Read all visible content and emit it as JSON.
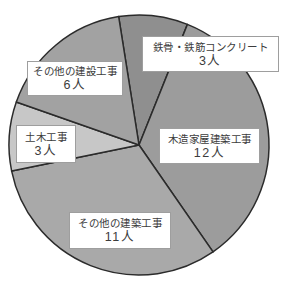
{
  "chart_data": {
    "type": "pie",
    "title": "",
    "unit": "人",
    "total": 35,
    "direction": "clockwise",
    "start_angle_deg": -9,
    "outline_color": "#2b2b2b",
    "background_color": "#ffffff",
    "slices": [
      {
        "label": "鉄骨・鉄筋コンクリート",
        "value": 3,
        "count_label": "3人",
        "color": "#8f8f8f"
      },
      {
        "label": "木造家屋建築工事",
        "value": 12,
        "count_label": "12人",
        "color": "#9c9c9c"
      },
      {
        "label": "その他の建築工事",
        "value": 11,
        "count_label": "11人",
        "color": "#a9a9a9"
      },
      {
        "label": "土木工事",
        "value": 3,
        "count_label": "3人",
        "color": "#c7c7c7"
      },
      {
        "label": "その他の建設工事",
        "value": 6,
        "count_label": "6人",
        "color": "#a2a2a2"
      }
    ]
  }
}
